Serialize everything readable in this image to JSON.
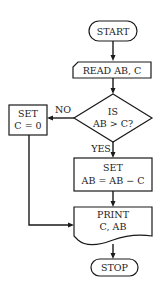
{
  "flowchart": {
    "nodes": [
      {
        "id": "start",
        "type": "terminal",
        "lines": [
          "START"
        ]
      },
      {
        "id": "read",
        "type": "input",
        "lines": [
          "READ AB, C"
        ]
      },
      {
        "id": "decision",
        "type": "decision",
        "lines": [
          "IS",
          "AB > C?"
        ]
      },
      {
        "id": "set_c",
        "type": "process",
        "lines": [
          "SET",
          "C = 0"
        ]
      },
      {
        "id": "set_ab",
        "type": "process",
        "lines": [
          "SET",
          "AB = AB − C"
        ]
      },
      {
        "id": "print",
        "type": "document",
        "lines": [
          "PRINT",
          "C, AB"
        ]
      },
      {
        "id": "stop",
        "type": "terminal",
        "lines": [
          "STOP"
        ]
      }
    ],
    "edge_labels": {
      "no": "NO",
      "yes": "YES"
    },
    "colors": {
      "stroke": "#1a1a1a",
      "text": "#222222",
      "background": "#ffffff"
    }
  }
}
